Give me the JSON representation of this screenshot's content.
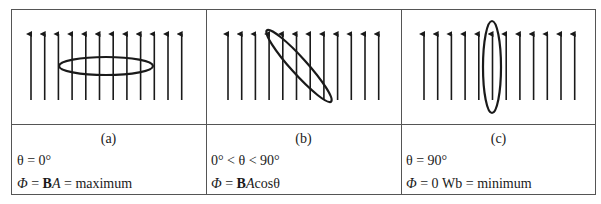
{
  "panels": [
    {
      "id": "a",
      "label": "(a)",
      "condition": "θ = 0°",
      "flux_symbol": "Φ",
      "flux_eq": " = ",
      "flux_B": "B",
      "flux_A": "A",
      "flux_rest": " = maximum",
      "loop_orientation": "horizontal (perpendicular to field)"
    },
    {
      "id": "b",
      "label": "(b)",
      "condition": "0° < θ < 90°",
      "flux_symbol": "Φ",
      "flux_eq": " = ",
      "flux_B": "B",
      "flux_A": "A",
      "flux_rest": "cosθ",
      "loop_orientation": "tilted"
    },
    {
      "id": "c",
      "label": "(c)",
      "condition": "θ = 90°",
      "flux_symbol": "Φ",
      "flux_eq": " = 0 Wb = minimum",
      "flux_B": "",
      "flux_A": "",
      "flux_rest": "",
      "loop_orientation": "vertical (parallel to field)"
    }
  ],
  "field_lines_per_panel": 12,
  "colors": {
    "line": "#1a1a1a",
    "border": "#555555",
    "background": "#ffffff"
  }
}
